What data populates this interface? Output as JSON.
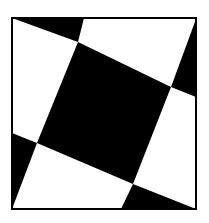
{
  "figure": {
    "colors": {
      "background": "#ffffff",
      "fill": "#000000",
      "border": "#000000"
    },
    "frame": {
      "x": 12,
      "y": 18,
      "width": 184,
      "height": 191
    },
    "regions": [
      {
        "name": "top-left-triangle",
        "fill": "#000000",
        "points": "12,18 84,18 78,42"
      },
      {
        "name": "top-right-triangle",
        "fill": "#000000",
        "points": "196,19 196,97 171,87"
      },
      {
        "name": "bottom-left-triangle",
        "fill": "#000000",
        "points": "12,133 37,143 12,209"
      },
      {
        "name": "bottom-right-triangle",
        "fill": "#000000",
        "points": "121,209 133,184 196,209"
      },
      {
        "name": "center-quadrilateral",
        "fill": "#000000",
        "points": "78,42 171,87 133,184 37,143"
      }
    ]
  }
}
